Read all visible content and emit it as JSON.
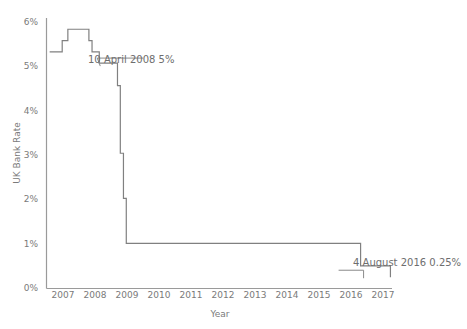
{
  "chart_data": {
    "type": "line",
    "title": "",
    "xlabel": "Year",
    "ylabel": "UK Bank Rate",
    "xlim": [
      2006.6,
      2017.6
    ],
    "ylim": [
      0,
      6
    ],
    "grid": false,
    "legend": "none",
    "line_color": "#808080",
    "axis_color": "#9a9a9a",
    "step_style": "post",
    "y_ticks": [
      {
        "value": 0,
        "label": "0%"
      },
      {
        "value": 1,
        "label": "1%"
      },
      {
        "value": 2,
        "label": "2%"
      },
      {
        "value": 3,
        "label": "3%"
      },
      {
        "value": 4,
        "label": "4%"
      },
      {
        "value": 5,
        "label": "5%"
      },
      {
        "value": 6,
        "label": "6%"
      }
    ],
    "x_ticks": [
      {
        "value": 2007,
        "label": "2007"
      },
      {
        "value": 2008,
        "label": "2008"
      },
      {
        "value": 2009,
        "label": "2009"
      },
      {
        "value": 2010,
        "label": "2010"
      },
      {
        "value": 2011,
        "label": "2011"
      },
      {
        "value": 2012,
        "label": "2012"
      },
      {
        "value": 2013,
        "label": "2013"
      },
      {
        "value": 2014,
        "label": "2014"
      },
      {
        "value": 2015,
        "label": "2015"
      },
      {
        "value": 2016,
        "label": "2016"
      },
      {
        "value": 2017,
        "label": "2017"
      }
    ],
    "series": [
      {
        "name": "UK Bank Rate",
        "x": [
          2006.7,
          2006.86,
          2007.1,
          2007.28,
          2007.45,
          2007.62,
          2007.95,
          2008.05,
          2008.14,
          2008.28,
          2008.78,
          2008.86,
          2008.95,
          2009.05,
          2009.14,
          2016.6,
          2017.55
        ],
        "y": [
          5.25,
          5.25,
          5.5,
          5.75,
          5.75,
          5.75,
          5.5,
          5.25,
          5.25,
          5.0,
          5.0,
          4.5,
          3.0,
          2.0,
          1.0,
          0.5,
          0.25
        ]
      }
    ],
    "annotations": [
      {
        "name": "annotation-2008",
        "text": "10 April 2008 5%",
        "x": 2008.28,
        "y": 5.0
      },
      {
        "name": "annotation-2016",
        "text": "4 August 2016 0.25%",
        "x": 2016.6,
        "y": 0.25
      }
    ]
  }
}
